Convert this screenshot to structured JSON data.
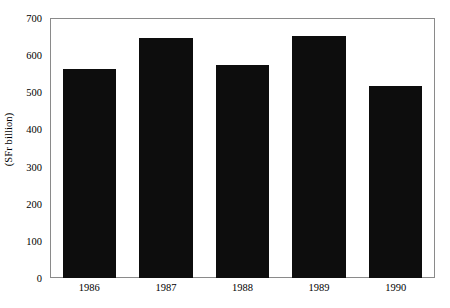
{
  "chart_data": {
    "type": "bar",
    "title": "",
    "subtitle": "",
    "xlabel": "",
    "ylabel": "(SFr billion)",
    "categories": [
      "1986",
      "1987",
      "1988",
      "1989",
      "1990"
    ],
    "values": [
      565,
      650,
      575,
      655,
      520
    ],
    "series": [
      {
        "name": "",
        "values": [
          565,
          650,
          575,
          655,
          520
        ]
      }
    ],
    "ylim": [
      0,
      700
    ],
    "yticks": [
      0,
      100,
      200,
      300,
      400,
      500,
      600,
      700
    ],
    "ytick_labels": [
      "0",
      "100",
      "200",
      "300",
      "400",
      "500",
      "600",
      "700"
    ],
    "grid": false,
    "legend": false,
    "legend_position": "none",
    "bar_color": "#0d0d0d",
    "frame_color": "#8a8a8a",
    "background_color": "#ffffff",
    "annotations": []
  },
  "axes": {
    "y_title": "(SFr billion)"
  }
}
